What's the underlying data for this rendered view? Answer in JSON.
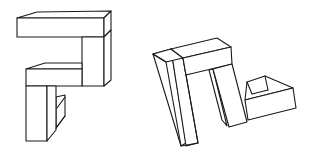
{
  "figure": {
    "description": "Mental rotation task: two 3D block-cube line drawings",
    "stroke_color": "#1a1a1a",
    "background_color": "#ffffff",
    "objects": [
      {
        "id": "left-object",
        "label": "Object A"
      },
      {
        "id": "right-object",
        "label": "Object B (rotated)"
      }
    ]
  }
}
